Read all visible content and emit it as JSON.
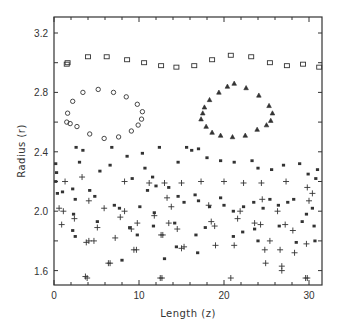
{
  "chart_data": {
    "type": "scatter",
    "title": "",
    "xlabel": "Length (z)",
    "ylabel": "Radius (r)",
    "xlim": [
      0,
      31.5
    ],
    "ylim": [
      1.5,
      3.3
    ],
    "x_ticks": [
      0,
      10,
      20,
      30
    ],
    "x_tick_labels": [
      "0",
      "10",
      "20",
      "30"
    ],
    "x_minor_step": 2,
    "y_ticks": [
      1.6,
      2.0,
      2.4,
      2.8,
      3.2
    ],
    "y_tick_labels": [
      "1.6",
      "2.0",
      "2.4",
      "2.8",
      "3.2"
    ],
    "y_minor_step": 0.2,
    "grid": false,
    "legend": null,
    "series": [
      {
        "name": "outer-boundary",
        "marker": "square",
        "points": [
          [
            1.5,
            2.99
          ],
          [
            1.6,
            3.0
          ],
          [
            4.0,
            3.04
          ],
          [
            6.2,
            3.04
          ],
          [
            8.6,
            3.02
          ],
          [
            10.6,
            3.0
          ],
          [
            12.6,
            2.98
          ],
          [
            14.4,
            2.97
          ],
          [
            16.5,
            2.98
          ],
          [
            18.6,
            3.02
          ],
          [
            20.8,
            3.05
          ],
          [
            23.2,
            3.04
          ],
          [
            25.4,
            3.0
          ],
          [
            27.4,
            2.98
          ],
          [
            29.3,
            2.99
          ],
          [
            31.2,
            2.97
          ]
        ]
      },
      {
        "name": "left-vortex",
        "marker": "circle",
        "points": [
          [
            1.5,
            2.6
          ],
          [
            1.6,
            2.66
          ],
          [
            2.2,
            2.74
          ],
          [
            3.4,
            2.8
          ],
          [
            5.2,
            2.82
          ],
          [
            7.0,
            2.8
          ],
          [
            8.5,
            2.77
          ],
          [
            9.8,
            2.72
          ],
          [
            10.4,
            2.67
          ],
          [
            10.3,
            2.62
          ],
          [
            9.9,
            2.58
          ],
          [
            9.1,
            2.54
          ],
          [
            7.6,
            2.5
          ],
          [
            5.9,
            2.49
          ],
          [
            4.2,
            2.52
          ],
          [
            2.7,
            2.57
          ],
          [
            1.9,
            2.59
          ]
        ]
      },
      {
        "name": "right-vortex",
        "marker": "triangle",
        "points": [
          [
            17.3,
            2.62
          ],
          [
            17.5,
            2.66
          ],
          [
            17.7,
            2.7
          ],
          [
            18.3,
            2.75
          ],
          [
            19.4,
            2.8
          ],
          [
            20.4,
            2.84
          ],
          [
            21.2,
            2.86
          ],
          [
            22.6,
            2.83
          ],
          [
            24.1,
            2.78
          ],
          [
            25.3,
            2.71
          ],
          [
            25.7,
            2.66
          ],
          [
            25.5,
            2.61
          ],
          [
            25.0,
            2.58
          ],
          [
            23.9,
            2.55
          ],
          [
            22.5,
            2.51
          ],
          [
            21.0,
            2.5
          ],
          [
            19.6,
            2.51
          ],
          [
            18.6,
            2.53
          ],
          [
            17.9,
            2.57
          ]
        ]
      },
      {
        "name": "asterisk-particles",
        "marker": "asterisk",
        "points": [
          [
            0.2,
            2.32
          ],
          [
            0.3,
            2.26
          ],
          [
            0.2,
            2.2
          ],
          [
            0.4,
            2.12
          ],
          [
            2.6,
            2.43
          ],
          [
            3.4,
            2.41
          ],
          [
            3.0,
            2.33
          ],
          [
            1.0,
            2.13
          ],
          [
            2.2,
            2.15
          ],
          [
            4.2,
            2.14
          ],
          [
            5.4,
            2.27
          ],
          [
            6.8,
            2.43
          ],
          [
            8.6,
            2.37
          ],
          [
            6.6,
            2.31
          ],
          [
            9.2,
            2.22
          ],
          [
            10.4,
            2.39
          ],
          [
            10.7,
            2.29
          ],
          [
            11.6,
            2.23
          ],
          [
            12.0,
            2.17
          ],
          [
            11.0,
            2.14
          ],
          [
            12.4,
            2.43
          ],
          [
            14.6,
            2.33
          ],
          [
            15.6,
            2.43
          ],
          [
            17.0,
            2.42
          ],
          [
            16.2,
            2.41
          ],
          [
            18.0,
            2.36
          ],
          [
            19.6,
            2.34
          ],
          [
            21.2,
            2.33
          ],
          [
            23.3,
            2.34
          ],
          [
            24.0,
            2.29
          ],
          [
            25.6,
            2.28
          ],
          [
            27.0,
            2.31
          ],
          [
            28.9,
            2.32
          ],
          [
            29.9,
            2.25
          ],
          [
            30.8,
            2.22
          ],
          [
            31.0,
            2.28
          ],
          [
            2.5,
            2.08
          ],
          [
            4.8,
            2.1
          ],
          [
            7.1,
            2.04
          ],
          [
            7.7,
            2.02
          ],
          [
            10.1,
            2.03
          ],
          [
            11.8,
            1.99
          ],
          [
            13.5,
            2.16
          ],
          [
            14.6,
            2.1
          ],
          [
            15.3,
            2.06
          ],
          [
            16.6,
            2.11
          ],
          [
            17.0,
            2.07
          ],
          [
            18.3,
            2.03
          ],
          [
            19.6,
            2.09
          ],
          [
            20.0,
            2.04
          ],
          [
            21.1,
            2.0
          ],
          [
            22.3,
            2.03
          ],
          [
            23.5,
            2.06
          ],
          [
            24.6,
            2.02
          ],
          [
            25.4,
            2.08
          ],
          [
            26.4,
            2.04
          ],
          [
            27.5,
            2.06
          ],
          [
            28.2,
            2.08
          ],
          [
            29.7,
            1.98
          ],
          [
            30.4,
            2.02
          ],
          [
            2.3,
            1.98
          ],
          [
            5.1,
            1.93
          ],
          [
            8.9,
            1.89
          ],
          [
            2.2,
            1.87
          ],
          [
            11.7,
            1.9
          ],
          [
            14.2,
            1.92
          ],
          [
            16.7,
            1.84
          ],
          [
            17.8,
            1.89
          ],
          [
            22.2,
            1.86
          ],
          [
            23.6,
            1.88
          ],
          [
            26.5,
            1.9
          ],
          [
            29.2,
            1.93
          ],
          [
            30.6,
            1.9
          ],
          [
            2.5,
            1.83
          ],
          [
            9.8,
            1.84
          ],
          [
            14.4,
            1.76
          ],
          [
            16.9,
            1.72
          ],
          [
            21.1,
            1.83
          ],
          [
            24.0,
            1.8
          ],
          [
            28.5,
            1.79
          ],
          [
            30.7,
            1.8
          ],
          [
            13.0,
            1.68
          ],
          [
            8.0,
            1.67
          ]
        ]
      },
      {
        "name": "plus-particles",
        "marker": "plus",
        "points": [
          [
            1.3,
            2.2
          ],
          [
            3.3,
            2.23
          ],
          [
            8.3,
            2.2
          ],
          [
            11.2,
            2.19
          ],
          [
            13.0,
            2.19
          ],
          [
            15.0,
            2.19
          ],
          [
            17.3,
            2.2
          ],
          [
            20.0,
            2.2
          ],
          [
            22.3,
            2.19
          ],
          [
            24.4,
            2.19
          ],
          [
            27.3,
            2.2
          ],
          [
            29.8,
            2.16
          ],
          [
            0.6,
            2.02
          ],
          [
            1.1,
            2.0
          ],
          [
            4.1,
            2.07
          ],
          [
            5.9,
            2.02
          ],
          [
            8.3,
            2.0
          ],
          [
            13.3,
            2.09
          ],
          [
            13.8,
            2.03
          ],
          [
            18.2,
            2.04
          ],
          [
            21.9,
            2.0
          ],
          [
            24.5,
            2.08
          ],
          [
            26.3,
            2.0
          ],
          [
            30.0,
            2.07
          ],
          [
            30.4,
            2.12
          ],
          [
            0.9,
            1.91
          ],
          [
            2.4,
            1.95
          ],
          [
            5.1,
            1.89
          ],
          [
            7.8,
            1.96
          ],
          [
            9.8,
            1.92
          ],
          [
            11.8,
            1.97
          ],
          [
            13.5,
            1.92
          ],
          [
            14.5,
            1.88
          ],
          [
            18.5,
            1.93
          ],
          [
            18.9,
            1.9
          ],
          [
            21.6,
            1.95
          ],
          [
            23.6,
            1.92
          ],
          [
            24.3,
            1.91
          ],
          [
            27.2,
            1.91
          ],
          [
            28.1,
            1.87
          ],
          [
            3.8,
            1.79
          ],
          [
            4.1,
            1.8
          ],
          [
            7.2,
            1.82
          ],
          [
            9.1,
            1.88
          ],
          [
            12.6,
            1.84
          ],
          [
            12.8,
            1.84
          ],
          [
            15.0,
            1.75
          ],
          [
            15.3,
            1.76
          ],
          [
            19.0,
            1.77
          ],
          [
            21.2,
            1.77
          ],
          [
            24.8,
            1.74
          ],
          [
            25.4,
            1.8
          ],
          [
            26.6,
            1.74
          ],
          [
            28.3,
            1.72
          ],
          [
            29.7,
            1.78
          ],
          [
            4.7,
            1.8
          ],
          [
            6.4,
            1.65
          ],
          [
            6.6,
            1.65
          ],
          [
            9.4,
            1.74
          ],
          [
            9.7,
            1.74
          ],
          [
            3.7,
            1.56
          ],
          [
            3.9,
            1.55
          ],
          [
            12.5,
            1.55
          ],
          [
            12.7,
            1.55
          ],
          [
            20.8,
            1.55
          ],
          [
            29.6,
            1.55
          ],
          [
            29.8,
            1.55
          ],
          [
            24.9,
            1.65
          ],
          [
            26.8,
            1.63
          ],
          [
            26.8,
            1.6
          ]
        ]
      }
    ]
  },
  "axes": {
    "x_label": "Length (z)",
    "y_label": "Radius (r)"
  },
  "colors": {
    "ink": "#333333",
    "background": "#ffffff"
  }
}
